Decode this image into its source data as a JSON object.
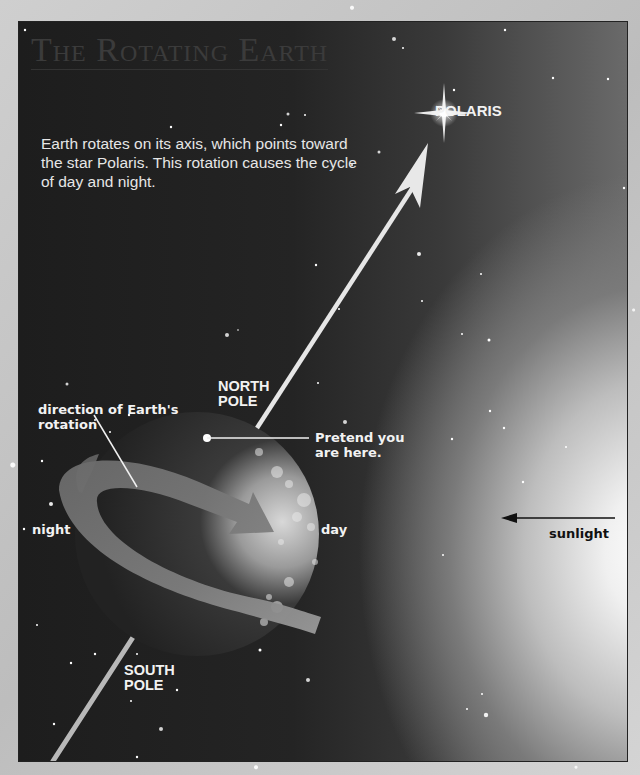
{
  "title": "The Rotating Earth",
  "intro": "Earth rotates on its axis, which points toward the star Polaris. This rotation causes the cycle of day and night.",
  "labels": {
    "polaris": "POLARIS",
    "north_pole_line1": "NORTH",
    "north_pole_line2": "POLE",
    "south_pole_line1": "SOUTH",
    "south_pole_line2": "POLE",
    "rotation_line1": "direction of Earth's",
    "rotation_line2": "rotation",
    "pretend_line1": "Pretend you",
    "pretend_line2": "are here.",
    "night": "night",
    "day": "day",
    "sunlight": "sunlight"
  },
  "icons": {
    "star": "polaris-star-icon",
    "earth": "earth-globe",
    "axis_arrow": "axis-arrow-icon",
    "rotation_arrow": "rotation-arrow-icon",
    "sunlight_arrow": "sunlight-arrow-icon"
  },
  "colors": {
    "space": "#222222",
    "label_text": "#f2f2f2",
    "sunlight_text": "#111111",
    "frame": "#c9c9c9"
  }
}
